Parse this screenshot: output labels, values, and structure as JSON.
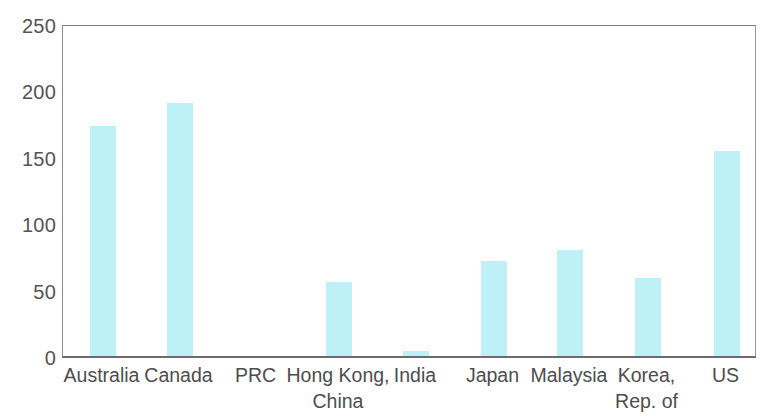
{
  "chart_data": {
    "type": "bar",
    "title": "",
    "subtitle": "",
    "xlabel": "",
    "ylabel": "",
    "ylim": [
      0,
      250
    ],
    "ytick_values": [
      0,
      50,
      100,
      150,
      200,
      250
    ],
    "ytick_labels": [
      "0",
      "50",
      "100",
      "150",
      "200",
      "250"
    ],
    "grid": false,
    "legend": false,
    "bar_color": "#bdf1f7",
    "axis_color": "#6b6b6b",
    "frame": true,
    "categories": [
      "Australia",
      "Canada",
      "PRC",
      "Hong Kong, China",
      "India",
      "Japan",
      "Malaysia",
      "Korea, Rep. of",
      "US"
    ],
    "category_lines": [
      [
        "Australia"
      ],
      [
        "Canada"
      ],
      [
        "PRC"
      ],
      [
        "Hong Kong,",
        "China"
      ],
      [
        "India"
      ],
      [
        "Japan"
      ],
      [
        "Malaysia"
      ],
      [
        "Korea,",
        "Rep. of"
      ],
      [
        "US"
      ]
    ],
    "values": [
      175,
      192,
      1,
      57,
      5,
      73,
      81,
      60,
      156
    ],
    "series": [
      {
        "name": "",
        "values": [
          175,
          192,
          1,
          57,
          5,
          73,
          81,
          60,
          156
        ]
      }
    ]
  },
  "axis": {
    "y_labels": [
      "250",
      "200",
      "150",
      "100",
      "50",
      "0"
    ]
  }
}
